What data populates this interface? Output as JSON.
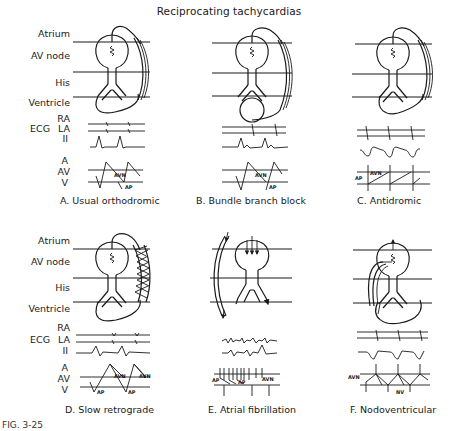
{
  "title": "Reciprocating tachycardias",
  "row_labels": {
    "atrium": "Atrium",
    "av_node": "AV node",
    "his": "His",
    "ventricle": "Ventricle",
    "ecg": "ECG",
    "ra": "RA",
    "la": "LA",
    "ii": "II",
    "a": "A",
    "av": "AV",
    "v": "V"
  },
  "panels": [
    {
      "id": "A",
      "caption": "A. Usual orthodromic",
      "ladder_labels": [
        "AVN",
        "AP"
      ]
    },
    {
      "id": "B",
      "caption": "B. Bundle branch block",
      "ladder_labels": [
        "AVN",
        "AP"
      ]
    },
    {
      "id": "C",
      "caption": "C. Antidromic",
      "ladder_labels": [
        "AP",
        "AVN"
      ]
    },
    {
      "id": "D",
      "caption": "D. Slow retrograde",
      "ladder_labels": [
        "AVN",
        "AVN",
        "AP",
        "AP"
      ]
    },
    {
      "id": "E",
      "caption": "E. Atrial fibrillation",
      "ladder_labels": [
        "AP",
        "AP",
        "AVN"
      ]
    },
    {
      "id": "F",
      "caption": "F. Nodoventricular",
      "ladder_labels": [
        "AVN",
        "NV"
      ]
    }
  ],
  "figure_caption_partial": "FIG. 3-25"
}
